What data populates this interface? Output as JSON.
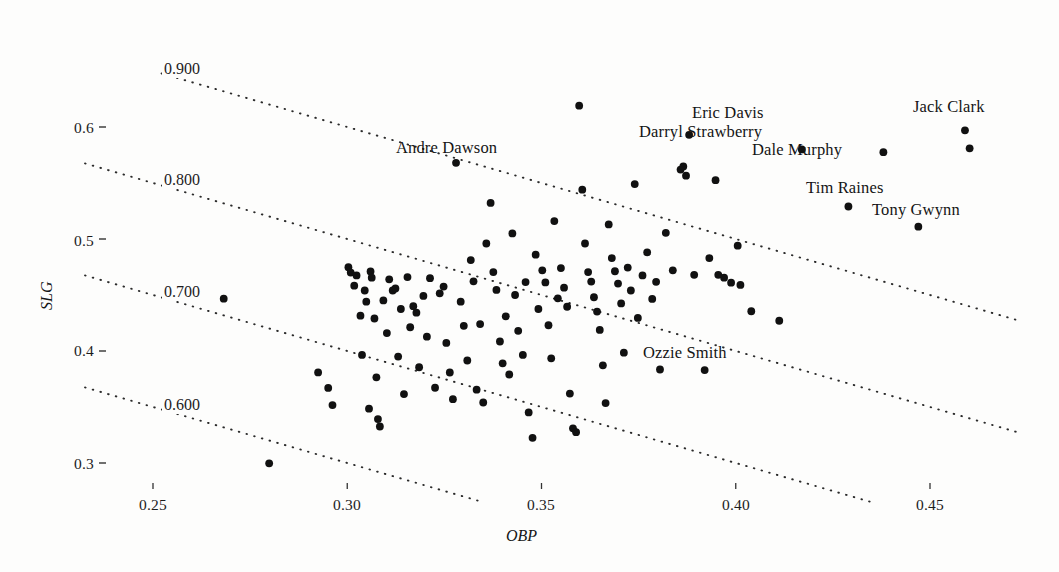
{
  "figure": {
    "background": "#fdfdfc",
    "ink": "#1a1a1a",
    "width": 1059,
    "height": 572
  },
  "axes": {
    "x_title": "OBP",
    "y_title": "SLG",
    "x_ticks": [
      "0.25",
      "0.30",
      "0.35",
      "0.40",
      "0.45"
    ],
    "y_ticks": [
      "0.6",
      "0.5",
      "0.4",
      "0.3"
    ],
    "x_tick_values": [
      0.25,
      0.3,
      0.35,
      0.4,
      0.45
    ],
    "y_tick_values": [
      0.6,
      0.5,
      0.4,
      0.3
    ]
  },
  "contours": {
    "labels": [
      "0.900",
      "0.800",
      "0.700",
      "0.600"
    ],
    "values": [
      0.9,
      0.8,
      0.7,
      0.6
    ],
    "meaning": "OPS = OBP + SLG"
  },
  "chart_data": {
    "type": "scatter",
    "title": "",
    "subtitle": "",
    "xlabel": "OBP",
    "ylabel": "SLG",
    "xlim": [
      0.2325,
      0.4725
    ],
    "ylim": [
      0.2655,
      0.6478
    ],
    "grid": false,
    "legend": null,
    "xticks": [
      0.25,
      0.3,
      0.35,
      0.4,
      0.45
    ],
    "yticks": [
      0.3,
      0.4,
      0.5,
      0.6
    ],
    "contour_lines": {
      "description": "dotted iso-OPS lines where SLG = OPS - OBP",
      "values": [
        0.6,
        0.7,
        0.8,
        0.9
      ],
      "labels": [
        "0.600",
        "0.700",
        "0.800",
        "0.900"
      ]
    },
    "annotations": [
      {
        "text": "Eric Davis",
        "x": 0.388,
        "y": 0.593,
        "anchor": "label-left-of-point"
      },
      {
        "text": "Darryl Strawberry",
        "x": 0.3865,
        "y": 0.564,
        "anchor": "label-left-of-point"
      },
      {
        "text": "Dale Murphy",
        "x": 0.417,
        "y": 0.58,
        "anchor": "label-left-of-point"
      },
      {
        "text": "Jack Clark",
        "x": 0.459,
        "y": 0.597,
        "anchor": "label-above-point"
      },
      {
        "text": "Tim Raines",
        "x": 0.429,
        "y": 0.529,
        "anchor": "label-right-of-point"
      },
      {
        "text": "Tony Gwynn",
        "x": 0.447,
        "y": 0.511,
        "anchor": "label-above-point"
      },
      {
        "text": "Andre Dawson",
        "x": 0.328,
        "y": 0.568,
        "anchor": "label-above-point"
      },
      {
        "text": "Ozzie Smith",
        "x": 0.392,
        "y": 0.383,
        "anchor": "label-above-point"
      }
    ],
    "series": [
      {
        "name": "players",
        "marker": "filled-circle",
        "color": "#111111",
        "points": [
          [
            0.2799,
            0.2997
          ],
          [
            0.2682,
            0.4467
          ],
          [
            0.2925,
            0.3809
          ],
          [
            0.2951,
            0.367
          ],
          [
            0.2962,
            0.3517
          ],
          [
            0.3003,
            0.4748
          ],
          [
            0.3009,
            0.47
          ],
          [
            0.3018,
            0.4583
          ],
          [
            0.3024,
            0.4675
          ],
          [
            0.3034,
            0.4315
          ],
          [
            0.3038,
            0.3965
          ],
          [
            0.3045,
            0.454
          ],
          [
            0.3049,
            0.444
          ],
          [
            0.3056,
            0.3485
          ],
          [
            0.306,
            0.471
          ],
          [
            0.3063,
            0.4655
          ],
          [
            0.307,
            0.429
          ],
          [
            0.3075,
            0.3765
          ],
          [
            0.3079,
            0.3392
          ],
          [
            0.3084,
            0.3326
          ],
          [
            0.3093,
            0.4452
          ],
          [
            0.3102,
            0.416
          ],
          [
            0.3108,
            0.464
          ],
          [
            0.3117,
            0.454
          ],
          [
            0.3124,
            0.4558
          ],
          [
            0.3131,
            0.395
          ],
          [
            0.3138,
            0.4375
          ],
          [
            0.3146,
            0.3615
          ],
          [
            0.3155,
            0.466
          ],
          [
            0.3162,
            0.4212
          ],
          [
            0.317,
            0.44
          ],
          [
            0.3178,
            0.4342
          ],
          [
            0.3185,
            0.3855
          ],
          [
            0.3196,
            0.4492
          ],
          [
            0.3205,
            0.4128
          ],
          [
            0.3213,
            0.465
          ],
          [
            0.3226,
            0.3672
          ],
          [
            0.3238,
            0.4515
          ],
          [
            0.3248,
            0.4575
          ],
          [
            0.3255,
            0.4072
          ],
          [
            0.3264,
            0.3808
          ],
          [
            0.3272,
            0.357
          ],
          [
            0.328,
            0.568
          ],
          [
            0.3292,
            0.444
          ],
          [
            0.33,
            0.4225
          ],
          [
            0.3309,
            0.3915
          ],
          [
            0.3318,
            0.4812
          ],
          [
            0.3325,
            0.4622
          ],
          [
            0.3333,
            0.3655
          ],
          [
            0.3342,
            0.424
          ],
          [
            0.335,
            0.354
          ],
          [
            0.3358,
            0.496
          ],
          [
            0.3369,
            0.5322
          ],
          [
            0.3376,
            0.4705
          ],
          [
            0.3384,
            0.4545
          ],
          [
            0.3393,
            0.4085
          ],
          [
            0.34,
            0.389
          ],
          [
            0.3408,
            0.431
          ],
          [
            0.3417,
            0.379
          ],
          [
            0.3425,
            0.505
          ],
          [
            0.3432,
            0.45
          ],
          [
            0.344,
            0.418
          ],
          [
            0.3452,
            0.3965
          ],
          [
            0.3459,
            0.4615
          ],
          [
            0.3467,
            0.3452
          ],
          [
            0.3477,
            0.3225
          ],
          [
            0.3485,
            0.486
          ],
          [
            0.3492,
            0.4375
          ],
          [
            0.3502,
            0.472
          ],
          [
            0.351,
            0.4612
          ],
          [
            0.3518,
            0.423
          ],
          [
            0.3525,
            0.3935
          ],
          [
            0.3533,
            0.516
          ],
          [
            0.3542,
            0.447
          ],
          [
            0.355,
            0.474
          ],
          [
            0.3558,
            0.4565
          ],
          [
            0.3566,
            0.4395
          ],
          [
            0.3573,
            0.362
          ],
          [
            0.3581,
            0.331
          ],
          [
            0.3589,
            0.3275
          ],
          [
            0.3597,
            0.619
          ],
          [
            0.3605,
            0.544
          ],
          [
            0.3612,
            0.496
          ],
          [
            0.362,
            0.4705
          ],
          [
            0.3628,
            0.462
          ],
          [
            0.3635,
            0.448
          ],
          [
            0.3643,
            0.4352
          ],
          [
            0.365,
            0.4188
          ],
          [
            0.3658,
            0.3872
          ],
          [
            0.3665,
            0.3535
          ],
          [
            0.3673,
            0.513
          ],
          [
            0.3681,
            0.483
          ],
          [
            0.3689,
            0.4712
          ],
          [
            0.3697,
            0.4602
          ],
          [
            0.3705,
            0.4425
          ],
          [
            0.3712,
            0.3985
          ],
          [
            0.3722,
            0.4745
          ],
          [
            0.373,
            0.454
          ],
          [
            0.374,
            0.549
          ],
          [
            0.3748,
            0.4295
          ],
          [
            0.376,
            0.4675
          ],
          [
            0.3772,
            0.488
          ],
          [
            0.3785,
            0.4465
          ],
          [
            0.3795,
            0.4618
          ],
          [
            0.3805,
            0.3835
          ],
          [
            0.382,
            0.5055
          ],
          [
            0.3838,
            0.472
          ],
          [
            0.3858,
            0.562
          ],
          [
            0.3865,
            0.5648
          ],
          [
            0.3872,
            0.5565
          ],
          [
            0.388,
            0.593
          ],
          [
            0.3893,
            0.468
          ],
          [
            0.392,
            0.383
          ],
          [
            0.3932,
            0.483
          ],
          [
            0.3948,
            0.5525
          ],
          [
            0.3955,
            0.468
          ],
          [
            0.397,
            0.4655
          ],
          [
            0.3988,
            0.461
          ],
          [
            0.4005,
            0.494
          ],
          [
            0.4012,
            0.459
          ],
          [
            0.404,
            0.4355
          ],
          [
            0.4112,
            0.427
          ],
          [
            0.417,
            0.58
          ],
          [
            0.429,
            0.529
          ],
          [
            0.438,
            0.5775
          ],
          [
            0.447,
            0.511
          ],
          [
            0.459,
            0.597
          ],
          [
            0.4602,
            0.581
          ]
        ]
      }
    ]
  }
}
